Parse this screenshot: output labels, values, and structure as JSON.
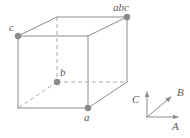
{
  "figure": {
    "width": 190,
    "height": 138,
    "background": "#ffffff",
    "line_color": "#8c8c8c",
    "hidden_line_color": "#a8a8a8",
    "vertex_dot_color": "#8a8a8a",
    "label_color": "#5a5a5a"
  },
  "cube": {
    "front_face": {
      "top_left": {
        "x": 18,
        "y": 36
      },
      "top_right": {
        "x": 88,
        "y": 36
      },
      "bottom_right": {
        "x": 88,
        "y": 108
      },
      "bottom_left": {
        "x": 18,
        "y": 108
      }
    },
    "back_face": {
      "top_left": {
        "x": 57,
        "y": 17
      },
      "top_right": {
        "x": 127,
        "y": 17
      },
      "bottom_right": {
        "x": 127,
        "y": 82
      },
      "bottom_left": {
        "x": 57,
        "y": 82
      }
    }
  },
  "vertices": [
    {
      "id": "c",
      "label": "c",
      "x": 18,
      "y": 36,
      "label_x": 9,
      "label_y": 22,
      "dot": true
    },
    {
      "id": "abc",
      "label": "abc",
      "x": 127,
      "y": 17,
      "label_x": 113,
      "label_y": 2,
      "dot": true
    },
    {
      "id": "b",
      "label": "b",
      "x": 57,
      "y": 82,
      "label_x": 60,
      "label_y": 67,
      "dot": true
    },
    {
      "id": "a",
      "label": "a",
      "x": 88,
      "y": 108,
      "label_x": 84,
      "label_y": 112,
      "dot": true
    }
  ],
  "axes": {
    "origin": {
      "x": 147,
      "y": 117
    },
    "items": [
      {
        "id": "A",
        "label": "A",
        "tip_x": 181,
        "tip_y": 117,
        "label_x": 172,
        "label_y": 121
      },
      {
        "id": "B",
        "label": "B",
        "tip_x": 174,
        "tip_y": 95,
        "label_x": 177,
        "label_y": 87
      },
      {
        "id": "C",
        "label": "C",
        "tip_x": 147,
        "tip_y": 89,
        "label_x": 132,
        "label_y": 94
      }
    ]
  }
}
